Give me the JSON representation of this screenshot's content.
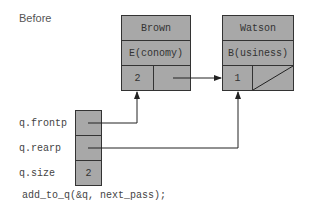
{
  "diagram": {
    "title": "Before",
    "nodes": [
      {
        "name": "Brown",
        "class": "E(conomy)",
        "value": "2"
      },
      {
        "name": "Watson",
        "class": "B(usiness)",
        "value": "1"
      }
    ],
    "queue": {
      "fields": [
        {
          "label": "q.frontp",
          "value": ""
        },
        {
          "label": "q.rearp",
          "value": ""
        },
        {
          "label": "q.size",
          "value": "2"
        }
      ]
    },
    "code": "add_to_q(&q, next_pass);",
    "colors": {
      "fill": "#a8a8a8",
      "stroke": "#333333",
      "background": "#ffffff"
    }
  }
}
